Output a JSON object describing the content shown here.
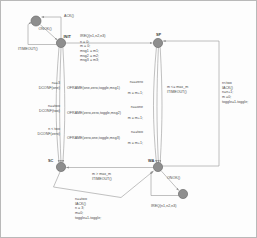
{
  "diagram": {
    "type": "state-transition-diagram",
    "colors": {
      "node_fill": "#8e8e8e",
      "node_stroke": "#6d6d6d",
      "edge": "#9a9a9a",
      "text": "#4a4a4a",
      "frame": "#b9b9b9",
      "background": "#fdfdfd"
    },
    "states": [
      {
        "id": "start",
        "label": "",
        "cx": 35,
        "cy": 20,
        "r": 5.0
      },
      {
        "id": "init",
        "label": "INIT",
        "cx": 60,
        "cy": 42,
        "r": 4.6
      },
      {
        "id": "sp",
        "label": "SP",
        "cx": 157,
        "cy": 42,
        "r": 4.6
      },
      {
        "id": "sc",
        "label": "SC",
        "cx": 60,
        "cy": 166,
        "r": 4.6
      },
      {
        "id": "wa",
        "label": "WA",
        "cx": 157,
        "cy": 166,
        "r": 4.6
      },
      {
        "id": "end",
        "label": "",
        "cx": 182,
        "cy": 193,
        "r": 4.6
      }
    ],
    "edge_labels": {
      "ack": "ACK()",
      "onok_top": "ONOK()",
      "itimeout_top": "ITIMEOUT()",
      "ireq_top": "IREQ(n1,n2,n3)",
      "init_actions": "n = 0;\nm = 0;\nmsg1 = m1;\nmsg2 = m2;\nmsg3 = m3;",
      "left_g1_guard": "n==3",
      "left_g1_act": "DCONF(one)",
      "left_g2_guard": "n==two",
      "left_g2_act": "DCONF(two)",
      "left_g3_guard": "n < two",
      "left_g3_act": "DCONF(zero)",
      "mid1_guard": "n==zero",
      "mid1_act": "OFRAME(one,zero,toggle,msg1)",
      "mid1_upd": "m = m+1;",
      "mid2_guard": "n==one",
      "mid2_act": "OFRAME(zero,zero,toggle,msg2)",
      "mid2_upd": "m = m+1;",
      "mid3_guard": "n==two",
      "mid3_act": "OFRAME(zero,one,toggle,msg3)",
      "mid3_upd": "m = m+1;",
      "right_guard": "m <= max_m",
      "right_act": "ITIMEOUT()",
      "far_right": "n<two\nIACK()\nn=n+1;\nm =0;\ntoggle=1-toggle;",
      "bottom_guard": "m > max_m",
      "bottom_act": "ITIMEOUT()",
      "bottom_block": "n==two\nIACK()\nn = 3;\nm=0;\ntoggle=1-toggle;",
      "onok_bottom": "ONOK()",
      "ireq_bottom": "IREQ(n1,n2,n3)"
    }
  }
}
